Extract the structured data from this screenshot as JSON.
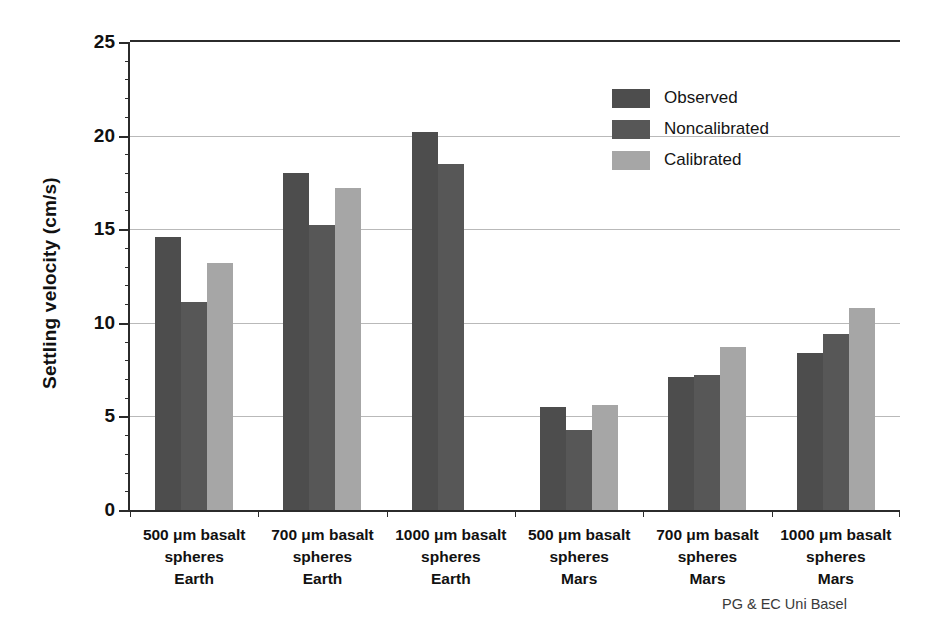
{
  "chart_data": {
    "type": "bar",
    "title": "",
    "xlabel": "",
    "ylabel": "Settling velocity (cm/s)",
    "ylim": [
      0,
      25
    ],
    "yticks": [
      0,
      5,
      10,
      15,
      20,
      25
    ],
    "ytick_labels": [
      "0",
      "5",
      "10",
      "15",
      "20",
      "25"
    ],
    "grid": true,
    "grid_axis": "y",
    "legend_position": "upper right (inside plot)",
    "categories": [
      "500 μm basalt\nspheres\nEarth",
      "700 μm basalt\nspheres\nEarth",
      "1000 μm basalt\nspheres\nEarth",
      "500 μm basalt\nspheres\nMars",
      "700 μm basalt\nspheres\nMars",
      "1000 μm basalt\nspheres\nMars"
    ],
    "category_lines": [
      [
        "500 μm basalt",
        "spheres",
        "Earth"
      ],
      [
        "700 μm basalt",
        "spheres",
        "Earth"
      ],
      [
        "1000 μm basalt",
        "spheres",
        "Earth"
      ],
      [
        "500 μm basalt",
        "spheres",
        "Mars"
      ],
      [
        "700 μm basalt",
        "spheres",
        "Mars"
      ],
      [
        "1000 μm basalt",
        "spheres",
        "Mars"
      ]
    ],
    "series": [
      {
        "name": "Observed",
        "color": "#4d4d4d",
        "values": [
          14.6,
          18.0,
          20.2,
          5.5,
          7.1,
          8.4
        ]
      },
      {
        "name": "Noncalibrated",
        "color": "#575757",
        "values": [
          11.1,
          15.2,
          18.5,
          4.3,
          7.2,
          9.4
        ]
      },
      {
        "name": "Calibrated",
        "color": "#a6a6a6",
        "values": [
          13.2,
          17.2,
          null,
          5.6,
          8.7,
          10.8
        ]
      }
    ]
  },
  "legend": {
    "items": [
      {
        "label": "Observed",
        "color": "#4d4d4d"
      },
      {
        "label": "Noncalibrated",
        "color": "#575757"
      },
      {
        "label": "Calibrated",
        "color": "#a6a6a6"
      }
    ]
  },
  "axes": {
    "y_title": "Settling velocity (cm/s)",
    "y_tick_labels": [
      "25",
      "20",
      "15",
      "10",
      "5",
      "0"
    ]
  },
  "annotations": {
    "credit": "PG & EC Uni Basel"
  },
  "colors": {
    "axis": "#2b2b2b",
    "gridline": "#b9b9b9",
    "text": "#111111",
    "credit_text": "#3a3a3a",
    "background": "#ffffff"
  }
}
